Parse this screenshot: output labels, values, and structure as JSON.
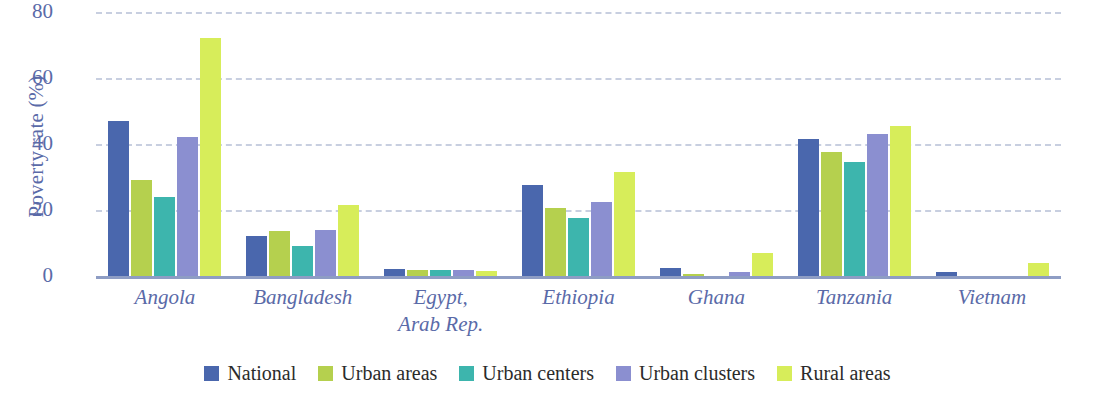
{
  "chart_data": {
    "type": "bar",
    "title": "",
    "subtitle": "",
    "xlabel": "",
    "ylabel": "Poverty rate (%)",
    "ylim": [
      0,
      80
    ],
    "yticks": [
      0,
      20,
      40,
      60,
      80
    ],
    "grid": true,
    "legend_position": "bottom",
    "categories": [
      "Angola",
      "Bangladesh",
      "Egypt,\nArab Rep.",
      "Ethiopia",
      "Ghana",
      "Tanzania",
      "Vietnam"
    ],
    "series": [
      {
        "name": "National",
        "color": "#4a67ad",
        "values": [
          47,
          12,
          2,
          27.5,
          2.5,
          41.5,
          1.3
        ]
      },
      {
        "name": "Urban areas",
        "color": "#b5d04e",
        "values": [
          29,
          13.5,
          1.8,
          20.5,
          0.7,
          37.5,
          0
        ]
      },
      {
        "name": "Urban centers",
        "color": "#3db5ad",
        "values": [
          24,
          9,
          1.8,
          17.5,
          0,
          34.5,
          0
        ]
      },
      {
        "name": "Urban clusters",
        "color": "#8b8fd0",
        "values": [
          42,
          14,
          1.8,
          22.5,
          1.2,
          43,
          0
        ]
      },
      {
        "name": "Rural areas",
        "color": "#d7ed5a",
        "values": [
          72,
          21.5,
          1.6,
          31.5,
          7,
          45.5,
          4
        ]
      }
    ]
  },
  "axis": {
    "y_title": "Poverty rate (%)",
    "y_tick_labels": [
      "80",
      "60",
      "40",
      "20",
      "0"
    ],
    "tick_color": "#5a6aa8",
    "gridline_color": "#c8cfe0",
    "baseline_color": "#8e9dc4"
  },
  "legend": {
    "items": [
      {
        "label": "National",
        "color": "#4a67ad"
      },
      {
        "label": "Urban areas",
        "color": "#b5d04e"
      },
      {
        "label": "Urban centers",
        "color": "#3db5ad"
      },
      {
        "label": "Urban clusters",
        "color": "#8b8fd0"
      },
      {
        "label": "Rural areas",
        "color": "#d7ed5a"
      }
    ]
  }
}
